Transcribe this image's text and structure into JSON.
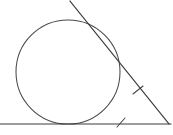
{
  "figure": {
    "title": "Circle inscribed in angle with two tangent lines",
    "background_color": "#ffffff",
    "stroke_color": "#3a3a3a",
    "width": 173,
    "height": 135,
    "circle": {
      "name": "inscribed-circle",
      "cx": 68,
      "cy": 72,
      "r": 52,
      "stroke_color": "#4a4a4a",
      "stroke_width": 1.05
    },
    "lines": [
      {
        "name": "horizontal-tangent-line",
        "x1": 0,
        "y1": 124,
        "x2": 171,
        "y2": 124,
        "stroke_color": "#3c3c3c",
        "stroke_width": 1.15
      },
      {
        "name": "slanted-tangent-line",
        "x1": 70,
        "y1": 1,
        "x2": 169,
        "y2": 124,
        "stroke_color": "#3c3c3c",
        "stroke_width": 1.15
      }
    ],
    "tangent_points": [
      {
        "name": "tangent-point-bottom",
        "x": 68,
        "y": 124
      },
      {
        "name": "tangent-point-upper",
        "x": 109,
        "y": 48
      }
    ],
    "vertex": {
      "name": "angle-vertex",
      "x": 169,
      "y": 124
    },
    "tick_marks": [
      {
        "name": "tick-mark-slanted-segment",
        "cx": 138,
        "cy": 90,
        "x1": 133,
        "y1": 94,
        "x2": 143,
        "y2": 86,
        "stroke_color": "#444444",
        "stroke_width": 1.05
      },
      {
        "name": "tick-mark-horizontal-segment",
        "cx": 121,
        "cy": 123,
        "x1": 117,
        "y1": 127,
        "x2": 125,
        "y2": 118,
        "stroke_color": "#444444",
        "stroke_width": 1.05
      }
    ]
  }
}
